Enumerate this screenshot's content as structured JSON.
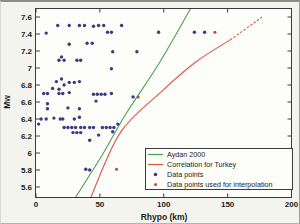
{
  "figure": {
    "bg": "#f4f4ef",
    "plot_bg": "#fdfdfa",
    "frame_color": "#3c3c3c",
    "text_color": "#1c1c1c"
  },
  "axes": {
    "x": {
      "label": "Rhypo (km)",
      "range": [
        0,
        200
      ],
      "tick_values": [
        0,
        50,
        100,
        150,
        200
      ],
      "tick_labels": [
        "0",
        "50",
        "100",
        "150",
        "200"
      ]
    },
    "y": {
      "label": "Mw",
      "range": [
        5.47,
        7.71
      ],
      "tick_values": [
        5.6,
        5.8,
        6.0,
        6.2,
        6.4,
        6.6,
        6.8,
        7.0,
        7.2,
        7.4,
        7.6
      ],
      "tick_labels": [
        "5.6",
        "5.8",
        "6",
        "6.2",
        "6.4",
        "6.6",
        "6.8",
        "7",
        "7.2",
        "7.4",
        "7.6"
      ]
    }
  },
  "legend": {
    "position": "south-east",
    "items": [
      {
        "label": "Aydan 2000",
        "marker": "line",
        "color": "#4ca24c"
      },
      {
        "label": "Correlation for Turkey",
        "marker": "line",
        "color": "#e0544a"
      },
      {
        "label": "Data points",
        "marker": "dot",
        "color": "#3b3b80"
      },
      {
        "label": "Data points used for interpolation",
        "marker": "dot",
        "color": "#c4473d"
      }
    ]
  },
  "chart_data": {
    "type": "scatter",
    "title": "",
    "xlabel": "Rhypo (km)",
    "ylabel": "Mw",
    "xlim": [
      0,
      200
    ],
    "ylim": [
      5.47,
      7.71
    ],
    "grid": false,
    "legend_position": "south-east",
    "series": [
      {
        "name": "Data points",
        "kind": "scatter",
        "marker": "circle",
        "color": "#3b3b80",
        "points": [
          [
            17,
            7.5
          ],
          [
            26,
            7.5
          ],
          [
            34,
            7.5
          ],
          [
            38,
            7.5
          ],
          [
            45,
            7.49
          ],
          [
            49,
            7.5
          ],
          [
            53,
            7.5
          ],
          [
            67,
            7.5
          ],
          [
            8,
            7.41
          ],
          [
            56,
            7.42
          ],
          [
            59,
            7.42
          ],
          [
            96,
            7.42
          ],
          [
            124,
            7.42
          ],
          [
            132,
            7.42
          ],
          [
            26,
            7.28
          ],
          [
            40,
            7.29
          ],
          [
            44,
            7.29
          ],
          [
            60,
            7.19
          ],
          [
            79,
            7.19
          ],
          [
            18,
            7.09
          ],
          [
            20,
            7.13
          ],
          [
            22,
            7.09
          ],
          [
            32,
            7.09
          ],
          [
            35,
            7.09
          ],
          [
            59,
            6.99
          ],
          [
            13,
            6.76
          ],
          [
            16,
            6.84
          ],
          [
            18,
            6.75
          ],
          [
            20,
            6.87
          ],
          [
            22,
            6.8
          ],
          [
            26,
            6.83
          ],
          [
            30,
            6.83
          ],
          [
            34,
            6.84
          ],
          [
            6,
            6.7
          ],
          [
            9,
            6.7
          ],
          [
            18,
            6.7
          ],
          [
            21,
            6.7
          ],
          [
            26,
            6.71
          ],
          [
            45,
            6.69
          ],
          [
            48,
            6.69
          ],
          [
            51,
            6.69
          ],
          [
            54,
            6.69
          ],
          [
            59,
            6.7
          ],
          [
            76,
            6.66
          ],
          [
            9,
            6.58
          ],
          [
            9,
            6.52
          ],
          [
            25,
            6.53
          ],
          [
            34,
            6.52
          ],
          [
            47,
            6.61
          ],
          [
            4,
            6.4
          ],
          [
            8,
            6.4
          ],
          [
            14,
            6.41
          ],
          [
            19,
            6.4
          ],
          [
            21,
            6.4
          ],
          [
            30,
            6.4
          ],
          [
            34,
            6.42
          ],
          [
            2,
            6.34
          ],
          [
            22,
            6.3
          ],
          [
            25,
            6.3
          ],
          [
            28,
            6.3
          ],
          [
            31,
            6.3
          ],
          [
            35,
            6.3
          ],
          [
            38,
            6.3
          ],
          [
            42,
            6.3
          ],
          [
            45,
            6.3
          ],
          [
            52,
            6.3
          ],
          [
            55,
            6.3
          ],
          [
            58,
            6.3
          ],
          [
            61,
            6.3
          ],
          [
            64,
            6.34
          ],
          [
            60,
            6.25
          ],
          [
            29,
            6.24
          ],
          [
            32,
            6.24
          ],
          [
            35,
            6.24
          ],
          [
            49,
            6.21
          ],
          [
            42,
            6.15
          ],
          [
            39,
            5.81
          ],
          [
            42,
            5.8
          ]
        ]
      },
      {
        "name": "Data points used for interpolation",
        "kind": "scatter",
        "marker": "circle",
        "color": "#c4473d",
        "points": [
          [
            63,
            5.81
          ],
          [
            80,
            6.66
          ],
          [
            140,
            7.42
          ]
        ]
      },
      {
        "name": "Aydan 2000",
        "kind": "line",
        "color": "#4ca24c",
        "points": [
          [
            31,
            5.48
          ],
          [
            52,
            5.98
          ],
          [
            70,
            6.45
          ],
          [
            97,
            7.07
          ],
          [
            121,
            7.7
          ]
        ]
      },
      {
        "name": "Correlation for Turkey",
        "kind": "line",
        "color": "#e0544a",
        "dash_from": 4,
        "points": [
          [
            43,
            5.48
          ],
          [
            66,
            6.24
          ],
          [
            98,
            6.72
          ],
          [
            125,
            7.07
          ],
          [
            152,
            7.33
          ],
          [
            177,
            7.6
          ]
        ]
      }
    ]
  }
}
